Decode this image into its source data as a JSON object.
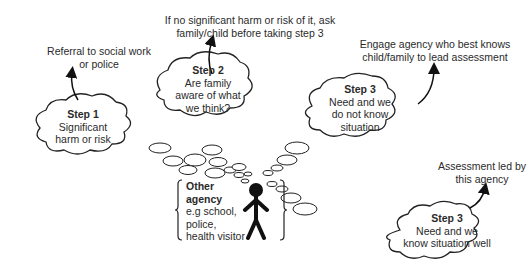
{
  "diagram": {
    "outcomes": {
      "referral": "Referral to social work or police",
      "ask_family": "If no significant harm or risk of it, ask family/child before taking step 3",
      "engage_agency": "Engage agency who best knows child/family to lead assessment",
      "assessment_led": "Assessment led by this agency"
    },
    "clouds": {
      "step1": {
        "title": "Step 1",
        "line1": "Significant",
        "line2": "harm or risk"
      },
      "step2": {
        "title": "Step 2",
        "line1": "Are family",
        "line2": "aware of what",
        "line3": "we think?"
      },
      "step3a": {
        "title": "Step 3",
        "line1": "Need and we",
        "line2": "do not know",
        "line3": "situation"
      },
      "step3b": {
        "title": "Step 3",
        "line1": "Need and we",
        "line2": "know situation well"
      }
    },
    "agency": {
      "title1": "Other",
      "title2": "agency",
      "line1": "e.g school,",
      "line2": "police,",
      "line3": "health visitor"
    }
  }
}
